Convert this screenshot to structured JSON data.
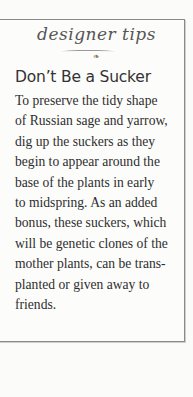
{
  "sidebar_box": {
    "banner": "designer tips",
    "ornament": "❧",
    "title": "Don’t Be a Sucker",
    "body_lines": [
      "To preserve the tidy shape",
      "of Russian sage and yarrow,",
      "dig up the suckers as they",
      "begin to appear around the",
      "base of the plants in early",
      "to midspring. As an added",
      "bonus, these suckers, which",
      "will be genetic clones of the",
      "mother plants, can be trans-",
      "planted or given away to",
      "friends."
    ]
  }
}
